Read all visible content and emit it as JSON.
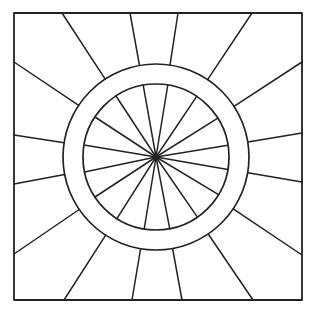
{
  "canvas": {
    "width": 313,
    "height": 316,
    "background": "#ffffff"
  },
  "style": {
    "stroke": "#222222",
    "frame_width": 1.8,
    "ring_width": 1.7,
    "spoke_width": 1.5
  },
  "frame": {
    "x1": 14,
    "y1": 13,
    "x2": 302,
    "y2": 300
  },
  "center": {
    "x": 156,
    "y": 157
  },
  "rings": {
    "inner_radius": 73,
    "outer_radius": 93
  },
  "inner_spokes": [
    [
      143,
      84
    ],
    [
      168,
      84
    ],
    [
      197,
      96
    ],
    [
      218,
      118
    ],
    [
      229,
      145
    ],
    [
      230,
      170
    ],
    [
      219,
      195
    ],
    [
      198,
      218
    ],
    [
      170,
      230
    ],
    [
      144,
      230
    ],
    [
      116,
      220
    ],
    [
      95,
      197
    ],
    [
      84,
      172
    ],
    [
      84,
      145
    ],
    [
      95,
      117
    ],
    [
      116,
      96
    ]
  ],
  "outer_spokes": [
    [
      62,
      13
    ],
    [
      130,
      13
    ],
    [
      178,
      13
    ],
    [
      252,
      13
    ],
    [
      302,
      62
    ],
    [
      302,
      133
    ],
    [
      302,
      182
    ],
    [
      302,
      255
    ],
    [
      253,
      300
    ],
    [
      182,
      300
    ],
    [
      132,
      300
    ],
    [
      64,
      300
    ],
    [
      14,
      254
    ],
    [
      14,
      184
    ],
    [
      14,
      135
    ],
    [
      14,
      62
    ]
  ]
}
